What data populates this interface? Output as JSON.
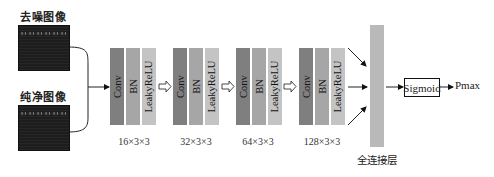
{
  "inputs": [
    {
      "label": "去噪图像",
      "name": "denoised-image"
    },
    {
      "label": "纯净图像",
      "name": "clean-image"
    }
  ],
  "blocks": [
    {
      "layers": [
        "Conv",
        "BN",
        "LeakyReLU"
      ],
      "dims": "16×3×3"
    },
    {
      "layers": [
        "Conv",
        "BN",
        "LeakyReLU"
      ],
      "dims": "32×3×3"
    },
    {
      "layers": [
        "Conv",
        "BN",
        "LeakyReLU"
      ],
      "dims": "64×3×3"
    },
    {
      "layers": [
        "Conv",
        "BN",
        "LeakyReLU"
      ],
      "dims": "128×3×3"
    }
  ],
  "fc": {
    "label": "全连接层"
  },
  "sigmoid": {
    "label": "Sigmoid"
  },
  "output": {
    "label": "Pmax"
  },
  "colors": {
    "conv": "#7f7f7f",
    "bn": "#a6a6a6",
    "relu": "#c4c4c4",
    "fc": "#b9b9b9"
  }
}
